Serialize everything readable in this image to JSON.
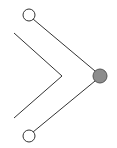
{
  "diagram": {
    "background": "#ffffff",
    "stroke_color": "#333333",
    "nodes": [
      {
        "id": "top-node",
        "cx": 29,
        "cy": 15,
        "r": 6,
        "fill": "#ffffff"
      },
      {
        "id": "bottom-node",
        "cx": 29,
        "cy": 136,
        "r": 6,
        "fill": "#ffffff"
      },
      {
        "id": "target-node",
        "cx": 100,
        "cy": 76,
        "r": 7,
        "fill": "#8c8c8c"
      }
    ],
    "edges": [
      {
        "id": "top-edge",
        "x1": 33,
        "y1": 19,
        "x2": 95,
        "y2": 71
      },
      {
        "id": "bottom-edge",
        "x1": 95,
        "y1": 81,
        "x2": 33,
        "y2": 132
      }
    ],
    "chevron": {
      "points": "14,33 62,76 14,118"
    }
  }
}
